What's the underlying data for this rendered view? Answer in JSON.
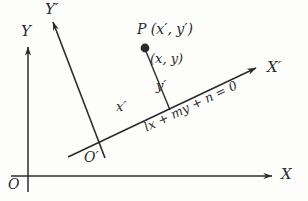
{
  "figure": {
    "kind": "geometry-diagram",
    "background_color": "#fdfdfc",
    "ink_color": "#2b2b2b",
    "axes": {
      "x_axis_label": "X",
      "y_axis_label": "Y",
      "origin_label": "O",
      "x_prime_axis_label": "X′",
      "y_prime_axis_label": "Y′",
      "prime_origin_label": "O′"
    },
    "point": {
      "name_label": "P (x′, y′)",
      "alt_coords_label": "(x, y)",
      "dot_color": "#2b2b2b"
    },
    "segments": {
      "x_prime_label": "x′",
      "y_prime_label": "y′"
    },
    "line_equation": "lx + my + n = 0"
  }
}
